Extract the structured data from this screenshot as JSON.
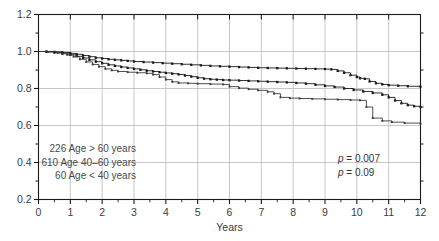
{
  "chart_data": {
    "type": "line",
    "title": "",
    "xlabel": "Years",
    "ylabel": "",
    "xlim": [
      0,
      12
    ],
    "ylim": [
      0.2,
      1.2
    ],
    "grid": true,
    "legend_position": "inside-lower-left",
    "x_ticks": [
      "0",
      "1",
      "2",
      "3",
      "4",
      "5",
      "6",
      "7",
      "8",
      "9",
      "10",
      "11",
      "12"
    ],
    "y_ticks": [
      "0.2",
      "0.4",
      "0.6",
      "0.8",
      "1.0",
      "1.2"
    ],
    "y_minor_ticks": [
      0.3,
      0.5,
      0.7,
      0.9,
      1.1
    ],
    "annotations": [
      {
        "name": "p-value-primary",
        "text": "p = 0.007",
        "italic_prefix": "p",
        "rest": " = 0.007"
      },
      {
        "name": "p-value-secondary",
        "text": "p = 0.09",
        "italic_prefix": "p",
        "rest": " = 0.09"
      }
    ],
    "legend": [
      {
        "count": "226",
        "label": "226 Age > 60 years",
        "group": "Age > 60 years"
      },
      {
        "count": "610",
        "label": "610 Age 40–60 years",
        "group": "Age 40–60 years"
      },
      {
        "count": "60",
        "label": "60 Age < 40 years",
        "group": "Age < 40 years"
      }
    ],
    "series": [
      {
        "name": "Age < 40 years",
        "color": "#1a1a1a",
        "marker": "square",
        "points": [
          [
            0,
            1.0
          ],
          [
            0.25,
            1.0
          ],
          [
            0.5,
            0.998
          ],
          [
            0.75,
            0.995
          ],
          [
            1.0,
            0.99
          ],
          [
            1.2,
            0.985
          ],
          [
            1.4,
            0.978
          ],
          [
            1.6,
            0.972
          ],
          [
            1.8,
            0.966
          ],
          [
            2.0,
            0.962
          ],
          [
            2.2,
            0.958
          ],
          [
            2.4,
            0.955
          ],
          [
            2.6,
            0.952
          ],
          [
            2.8,
            0.949
          ],
          [
            3.0,
            0.946
          ],
          [
            3.3,
            0.943
          ],
          [
            3.6,
            0.94
          ],
          [
            3.9,
            0.937
          ],
          [
            4.2,
            0.934
          ],
          [
            4.5,
            0.931
          ],
          [
            4.8,
            0.928
          ],
          [
            5.1,
            0.925
          ],
          [
            5.4,
            0.922
          ],
          [
            5.7,
            0.92
          ],
          [
            6.0,
            0.918
          ],
          [
            6.3,
            0.916
          ],
          [
            6.6,
            0.914
          ],
          [
            6.9,
            0.912
          ],
          [
            7.2,
            0.911
          ],
          [
            7.5,
            0.91
          ],
          [
            7.8,
            0.909
          ],
          [
            8.1,
            0.908
          ],
          [
            8.4,
            0.907
          ],
          [
            8.7,
            0.906
          ],
          [
            9.0,
            0.905
          ],
          [
            9.2,
            0.903
          ],
          [
            9.4,
            0.895
          ],
          [
            9.6,
            0.885
          ],
          [
            9.8,
            0.872
          ],
          [
            10.0,
            0.862
          ],
          [
            10.1,
            0.855
          ],
          [
            10.25,
            0.852
          ],
          [
            10.4,
            0.838
          ],
          [
            10.6,
            0.828
          ],
          [
            10.8,
            0.822
          ],
          [
            11.0,
            0.818
          ],
          [
            11.3,
            0.815
          ],
          [
            11.6,
            0.812
          ],
          [
            12.0,
            0.81
          ]
        ]
      },
      {
        "name": "Age 40-60 years",
        "color": "#1a1a1a",
        "marker": "square",
        "points": [
          [
            0,
            1.0
          ],
          [
            0.25,
            0.998
          ],
          [
            0.5,
            0.994
          ],
          [
            0.75,
            0.988
          ],
          [
            1.0,
            0.982
          ],
          [
            1.2,
            0.974
          ],
          [
            1.4,
            0.965
          ],
          [
            1.6,
            0.955
          ],
          [
            1.8,
            0.945
          ],
          [
            2.0,
            0.936
          ],
          [
            2.2,
            0.928
          ],
          [
            2.4,
            0.922
          ],
          [
            2.6,
            0.916
          ],
          [
            2.8,
            0.911
          ],
          [
            3.0,
            0.906
          ],
          [
            3.2,
            0.901
          ],
          [
            3.4,
            0.896
          ],
          [
            3.6,
            0.892
          ],
          [
            3.8,
            0.888
          ],
          [
            4.0,
            0.884
          ],
          [
            4.2,
            0.88
          ],
          [
            4.4,
            0.876
          ],
          [
            4.6,
            0.87
          ],
          [
            4.8,
            0.864
          ],
          [
            5.0,
            0.858
          ],
          [
            5.2,
            0.853
          ],
          [
            5.4,
            0.85
          ],
          [
            5.6,
            0.848
          ],
          [
            5.8,
            0.846
          ],
          [
            6.0,
            0.845
          ],
          [
            6.3,
            0.843
          ],
          [
            6.6,
            0.841
          ],
          [
            6.9,
            0.839
          ],
          [
            7.2,
            0.837
          ],
          [
            7.5,
            0.835
          ],
          [
            7.8,
            0.833
          ],
          [
            8.1,
            0.83
          ],
          [
            8.4,
            0.826
          ],
          [
            8.7,
            0.82
          ],
          [
            9.0,
            0.814
          ],
          [
            9.3,
            0.808
          ],
          [
            9.6,
            0.8
          ],
          [
            9.9,
            0.792
          ],
          [
            10.2,
            0.784
          ],
          [
            10.5,
            0.776
          ],
          [
            10.8,
            0.766
          ],
          [
            11.0,
            0.752
          ],
          [
            11.2,
            0.735
          ],
          [
            11.4,
            0.72
          ],
          [
            11.6,
            0.71
          ],
          [
            11.8,
            0.704
          ],
          [
            12.0,
            0.7
          ]
        ]
      },
      {
        "name": "Age > 60 years",
        "color": "#3a3a3a",
        "marker": "square-small",
        "points": [
          [
            0,
            1.0
          ],
          [
            0.3,
            0.998
          ],
          [
            0.6,
            0.992
          ],
          [
            0.9,
            0.982
          ],
          [
            1.1,
            0.972
          ],
          [
            1.3,
            0.958
          ],
          [
            1.5,
            0.944
          ],
          [
            1.7,
            0.93
          ],
          [
            1.9,
            0.918
          ],
          [
            2.1,
            0.906
          ],
          [
            2.3,
            0.898
          ],
          [
            2.5,
            0.892
          ],
          [
            2.8,
            0.888
          ],
          [
            3.1,
            0.885
          ],
          [
            3.4,
            0.882
          ],
          [
            3.6,
            0.875
          ],
          [
            3.8,
            0.862
          ],
          [
            4.0,
            0.848
          ],
          [
            4.2,
            0.836
          ],
          [
            4.4,
            0.83
          ],
          [
            4.7,
            0.828
          ],
          [
            5.0,
            0.826
          ],
          [
            5.4,
            0.824
          ],
          [
            5.8,
            0.822
          ],
          [
            6.0,
            0.81
          ],
          [
            6.3,
            0.802
          ],
          [
            6.6,
            0.796
          ],
          [
            6.9,
            0.79
          ],
          [
            7.2,
            0.782
          ],
          [
            7.4,
            0.772
          ],
          [
            7.6,
            0.752
          ],
          [
            7.9,
            0.748
          ],
          [
            8.2,
            0.746
          ],
          [
            8.6,
            0.744
          ],
          [
            9.0,
            0.742
          ],
          [
            9.4,
            0.74
          ],
          [
            9.8,
            0.738
          ],
          [
            10.1,
            0.736
          ],
          [
            10.3,
            0.7
          ],
          [
            10.5,
            0.64
          ],
          [
            10.8,
            0.625
          ],
          [
            11.1,
            0.618
          ],
          [
            11.5,
            0.613
          ],
          [
            12.0,
            0.61
          ]
        ]
      }
    ]
  }
}
